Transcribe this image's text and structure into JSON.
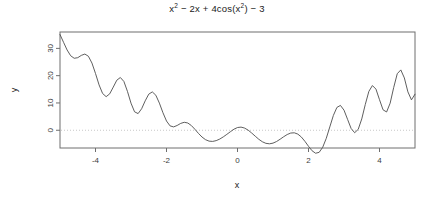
{
  "chart_data": {
    "type": "line",
    "title_parts": {
      "t1": "x",
      "sup1": "2",
      "t2": " − 2x + 4cos(x",
      "sup2": "2",
      "t3": ") − 3"
    },
    "xlabel": "x",
    "ylabel": "y",
    "xlim": [
      -5,
      5
    ],
    "ylim": [
      -6.5,
      36
    ],
    "xticks": [
      -4,
      -2,
      0,
      2,
      4
    ],
    "xtick_labels": [
      "-4",
      "-2",
      "0",
      "2",
      "4"
    ],
    "yticks": [
      0,
      10,
      20,
      30
    ],
    "ytick_labels": [
      "0",
      "10",
      "20",
      "30"
    ],
    "grid": false,
    "legend": "none",
    "line_color": "#4d4d4d",
    "reference_line": {
      "y": 0,
      "style": "dotted",
      "color": "#c8c8c8"
    },
    "box_color": "#6e6e6e",
    "expression": "x^2 - 2*x + 4*cos(x^2) - 3",
    "x": [
      -5,
      -4.9,
      -4.8,
      -4.7,
      -4.6,
      -4.5,
      -4.4,
      -4.3,
      -4.2,
      -4.1,
      -4,
      -3.9,
      -3.8,
      -3.7,
      -3.6,
      -3.5,
      -3.4,
      -3.3,
      -3.2,
      -3.1,
      -3,
      -2.9,
      -2.8,
      -2.7,
      -2.6,
      -2.5,
      -2.4,
      -2.3,
      -2.2,
      -2.1,
      -2,
      -1.9,
      -1.8,
      -1.7,
      -1.6,
      -1.5,
      -1.4,
      -1.3,
      -1.2,
      -1.1,
      -1,
      -0.9,
      -0.8,
      -0.7,
      -0.6,
      -0.5,
      -0.4,
      -0.3,
      -0.2,
      -0.1,
      0,
      0.1,
      0.2,
      0.3,
      0.4,
      0.5,
      0.6,
      0.7,
      0.8,
      0.9,
      1,
      1.1,
      1.2,
      1.3,
      1.4,
      1.5,
      1.6,
      1.7,
      1.8,
      1.9,
      2,
      2.1,
      2.2,
      2.3,
      2.4,
      2.5,
      2.6,
      2.7,
      2.8,
      2.9,
      3,
      3.1,
      3.2,
      3.3,
      3.4,
      3.5,
      3.6,
      3.7,
      3.8,
      3.9,
      4,
      4.1,
      4.2,
      4.3,
      4.4,
      4.5,
      4.6,
      4.7,
      4.8,
      4.9,
      5
    ],
    "y": [
      35.07,
      32.22,
      29.41,
      27.31,
      26.37,
      26.59,
      27.43,
      27.92,
      27.11,
      24.62,
      20.8,
      16.63,
      13.47,
      12.31,
      13.34,
      15.81,
      18.34,
      19.33,
      17.87,
      14.25,
      9.92,
      6.76,
      6.11,
      7.89,
      10.78,
      13.23,
      14.05,
      12.83,
      9.94,
      6.42,
      3.38,
      1.6,
      1.23,
      1.75,
      2.51,
      2.92,
      2.66,
      1.73,
      0.36,
      -1.15,
      -2.48,
      -3.46,
      -3.99,
      -4.09,
      -3.8,
      -3.22,
      -2.42,
      -1.5,
      -0.53,
      0.39,
      1.0,
      1.15,
      0.8,
      0.04,
      -1.01,
      -2.18,
      -3.3,
      -4.21,
      -4.79,
      -4.96,
      -4.72,
      -4.13,
      -3.29,
      -2.38,
      -1.56,
      -1.02,
      -0.93,
      -1.41,
      -2.49,
      -4.07,
      -5.88,
      -7.51,
      -8.42,
      -8.09,
      -6.24,
      -2.98,
      1.22,
      5.41,
      8.37,
      9.1,
      7.36,
      4.01,
      0.66,
      -0.9,
      0.32,
      4.15,
      9.47,
      14.23,
      16.38,
      15.08,
      11.2,
      7.49,
      6.7,
      9.93,
      15.66,
      20.72,
      22.11,
      19.18,
      14.07,
      11.14,
      13.21
    ]
  }
}
